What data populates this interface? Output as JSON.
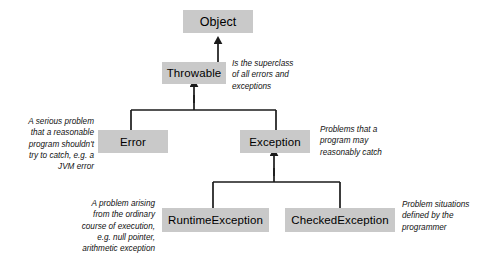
{
  "diagram": {
    "background_color": "#ffffff",
    "node_fill_color": "#c9c9c9",
    "edge_color": "#1a1a1a",
    "nodes": [
      {
        "id": "object",
        "label": "Object",
        "x": 183,
        "y": 10,
        "w": 70,
        "h": 23,
        "font_size": 12.5
      },
      {
        "id": "throwable",
        "label": "Throwable",
        "x": 162,
        "y": 62,
        "w": 64,
        "h": 22,
        "font_size": 11.5
      },
      {
        "id": "error",
        "label": "Error",
        "x": 98,
        "y": 130,
        "w": 70,
        "h": 23,
        "font_size": 11.5
      },
      {
        "id": "exception",
        "label": "Exception",
        "x": 240,
        "y": 130,
        "w": 70,
        "h": 23,
        "font_size": 11.5
      },
      {
        "id": "runtimeexception",
        "label": "RuntimeException",
        "x": 162,
        "y": 208,
        "w": 107,
        "h": 24,
        "font_size": 11.5
      },
      {
        "id": "checkedexception",
        "label": "CheckedException",
        "x": 285,
        "y": 208,
        "w": 110,
        "h": 24,
        "font_size": 11.5
      }
    ],
    "edges": [
      {
        "id": "object-throwable",
        "from": "throwable",
        "to": "object",
        "kind": "generalization"
      },
      {
        "id": "throwable-error",
        "from": "error",
        "to": "throwable",
        "kind": "generalization"
      },
      {
        "id": "throwable-exception",
        "from": "exception",
        "to": "throwable",
        "kind": "generalization"
      },
      {
        "id": "exception-runtimeexception",
        "from": "runtimeexception",
        "to": "exception",
        "kind": "generalization"
      },
      {
        "id": "exception-checkedexception",
        "from": "checkedexception",
        "to": "exception",
        "kind": "generalization"
      }
    ],
    "notes": [
      {
        "id": "note-throwable",
        "text": "Is the superclass\nof all errors and\nexceptions",
        "align": "left",
        "x": 232,
        "y": 58,
        "w": 105
      },
      {
        "id": "note-error",
        "text": "A serious problem\nthat a reasonable\nprogram shouldn't\ntry to catch, e.g. a\nJVM error",
        "align": "right",
        "x": 8,
        "y": 116,
        "w": 86
      },
      {
        "id": "note-exception",
        "text": "Problems that a\nprogram may\nreasonably catch",
        "align": "left",
        "x": 320,
        "y": 124,
        "w": 100
      },
      {
        "id": "note-runtimeexception",
        "text": "A problem arising\nfrom the ordinary\ncourse of execution,\ne.g. null pointer,\narithmetic exception",
        "align": "right",
        "x": 60,
        "y": 198,
        "w": 95
      },
      {
        "id": "note-checkedexception",
        "text": "Problem situations\ndefined by the\nprogrammer",
        "align": "left",
        "x": 402,
        "y": 199,
        "w": 78
      }
    ]
  }
}
